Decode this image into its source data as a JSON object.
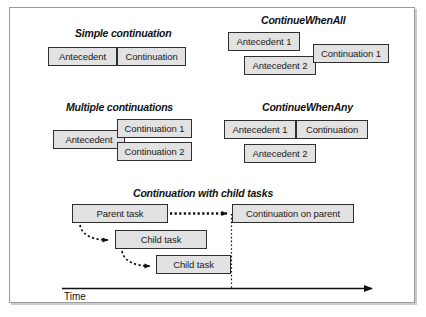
{
  "figure": {
    "background": "#ffffff",
    "box_fill": "#e2e2e2",
    "box_border": "#2e2e2e",
    "frame_border": "#9b9b9b"
  },
  "sections": {
    "simple": {
      "title": "Simple continuation",
      "boxes": {
        "antecedent": "Antecedent",
        "continuation": "Continuation"
      }
    },
    "multiple": {
      "title": "Multiple continuations",
      "boxes": {
        "antecedent": "Antecedent",
        "continuation1": "Continuation 1",
        "continuation2": "Continuation 2"
      }
    },
    "when_all": {
      "title": "ContinueWhenAll",
      "boxes": {
        "antecedent1": "Antecedent 1",
        "antecedent2": "Antecedent 2",
        "continuation1": "Continuation 1"
      }
    },
    "when_any": {
      "title": "ContinueWhenAny",
      "boxes": {
        "antecedent1": "Antecedent 1",
        "antecedent2": "Antecedent 2",
        "continuation": "Continuation"
      }
    },
    "child_tasks": {
      "title": "Continuation with child tasks",
      "boxes": {
        "parent": "Parent task",
        "child1": "Child task",
        "child2": "Child task",
        "continuation": "Continuation on parent"
      },
      "axis": {
        "label": "Time"
      }
    }
  }
}
